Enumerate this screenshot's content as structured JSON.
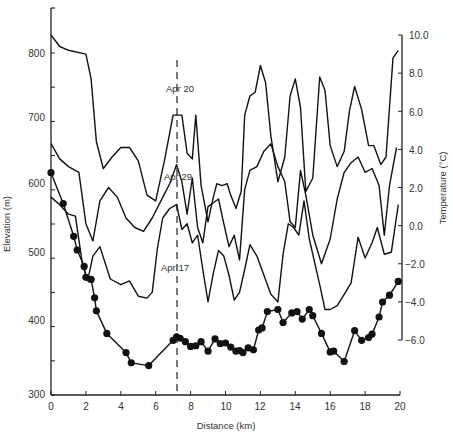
{
  "chart_data": {
    "type": "line",
    "title": "",
    "xlabel": "Distance (km)",
    "ylabel": "Elevation (m)",
    "y2label": "Temperature (°C)",
    "xlim": [
      0,
      20
    ],
    "ylim": [
      300,
      850
    ],
    "y2lim": [
      -6.0,
      10.0
    ],
    "xticks": [
      "0",
      "2",
      "4",
      "6",
      "8",
      "10",
      "12",
      "14",
      "16",
      "18",
      "20"
    ],
    "yticks": [
      "300",
      "400",
      "500",
      "600",
      "700",
      "800"
    ],
    "y2ticks": [
      "10.0",
      "8.0",
      "6.0",
      "4.0",
      "2.0",
      "0.0",
      "−2.0",
      "−4.0",
      "−6.0"
    ],
    "grid": false,
    "annotations": [
      {
        "text": "Apr 20",
        "x": 7.1,
        "y": 725
      },
      {
        "text": "Apr 29",
        "x": 7.1,
        "y": 602
      },
      {
        "text": "Apr 17",
        "x": 6.3,
        "y": 480
      },
      {
        "text": "dashed vertical line",
        "x": 7.2
      }
    ],
    "series": [
      {
        "name": "Elevation profile",
        "axis": "left",
        "marker": "filled-circle",
        "x": [
          0,
          0.7,
          1.3,
          1.5,
          1.9,
          2.0,
          2.3,
          2.5,
          2.6,
          3.2,
          4.3,
          4.6,
          5.6,
          7.0,
          7.2,
          7.4,
          7.7,
          8.0,
          8.3,
          8.6,
          9.0,
          9.4,
          9.7,
          10.0,
          10.3,
          10.6,
          10.8,
          11.0,
          11.3,
          11.6,
          11.9,
          12.1,
          12.4,
          13.0,
          13.3,
          13.8,
          14.1,
          14.4,
          14.8,
          15.0,
          15.5,
          16.0,
          16.2,
          16.8,
          17.4,
          17.8,
          18.2,
          18.4,
          18.8,
          19.0,
          19.4,
          19.9
        ],
        "y": [
          625,
          580,
          532,
          512,
          488,
          472,
          469,
          442,
          423,
          390,
          362,
          347,
          343,
          380,
          385,
          383,
          378,
          371,
          372,
          378,
          364,
          382,
          375,
          376,
          370,
          364,
          365,
          362,
          369,
          366,
          395,
          398,
          422,
          425,
          406,
          420,
          422,
          411,
          425,
          416,
          390,
          363,
          364,
          349,
          394,
          380,
          384,
          389,
          414,
          436,
          446,
          466
        ]
      },
      {
        "name": "Apr 20",
        "axis": "right",
        "x": [
          0,
          0.5,
          1.0,
          2.0,
          2.3,
          2.6,
          3.0,
          3.5,
          4.0,
          4.5,
          5.0,
          5.5,
          6.0,
          6.5,
          7.0,
          7.5,
          7.8,
          8.1,
          8.3,
          8.6,
          9.0,
          9.3,
          9.5,
          9.8,
          10.1,
          10.3,
          10.6,
          10.9,
          11.1,
          11.4,
          11.7,
          12.0,
          12.3,
          12.6,
          13.0,
          13.4,
          13.7,
          14.0,
          14.3,
          14.6,
          15.0,
          15.4,
          15.7,
          16.0,
          16.4,
          16.8,
          17.1,
          17.4,
          17.8,
          18.2,
          18.5,
          18.9,
          19.2,
          19.6,
          19.9
        ],
        "y": [
          10.0,
          9.4,
          9.2,
          9.0,
          7.7,
          4.4,
          3.0,
          3.6,
          4.1,
          4.1,
          3.4,
          1.6,
          1.3,
          3.4,
          5.8,
          5.8,
          3.8,
          3.5,
          5.8,
          2.1,
          0.2,
          1.5,
          2.2,
          2.1,
          2.2,
          1.6,
          0.9,
          1.8,
          5.8,
          6.8,
          7.0,
          8.4,
          7.5,
          4.7,
          2.3,
          3.6,
          6.8,
          7.7,
          6.2,
          1.8,
          2.5,
          7.8,
          7.1,
          4.2,
          3.1,
          3.9,
          6.0,
          7.3,
          6.1,
          4.2,
          4.2,
          3.2,
          3.6,
          8.8,
          9.2
        ]
      },
      {
        "name": "Apr 29",
        "axis": "right",
        "x": [
          0,
          0.5,
          1.0,
          1.6,
          2.0,
          2.4,
          2.8,
          3.3,
          3.8,
          4.3,
          4.8,
          5.3,
          5.8,
          6.3,
          6.8,
          7.2,
          7.5,
          7.8,
          8.1,
          8.4,
          8.7,
          9.0,
          9.3,
          9.6,
          9.9,
          10.2,
          10.5,
          10.8,
          11.1,
          11.4,
          11.8,
          12.2,
          12.6,
          13.0,
          13.4,
          13.7,
          14.0,
          14.3,
          14.6,
          15.0,
          15.5,
          16.0,
          16.4,
          16.8,
          17.2,
          17.6,
          18.0,
          18.4,
          18.8,
          19.1,
          19.4,
          19.8
        ],
        "y": [
          4.3,
          3.5,
          3.1,
          2.8,
          0.1,
          -0.8,
          1.3,
          2.0,
          1.5,
          0.4,
          -0.1,
          -0.3,
          0.4,
          1.3,
          2.2,
          3.2,
          2.3,
          0.6,
          2.5,
          -0.1,
          -0.9,
          1.0,
          1.2,
          1.4,
          0.1,
          -1.1,
          -0.5,
          -1.8,
          1.9,
          2.9,
          3.1,
          3.9,
          4.3,
          3.1,
          2.3,
          0.2,
          -0.1,
          2.9,
          1.6,
          -0.5,
          -2.0,
          -0.7,
          1.4,
          2.8,
          3.3,
          3.6,
          2.8,
          3.0,
          2.1,
          -0.5,
          2.1,
          4.1
        ]
      },
      {
        "name": "Apr 17",
        "axis": "right",
        "x": [
          0,
          0.5,
          1.0,
          1.4,
          1.8,
          2.1,
          2.4,
          2.8,
          3.4,
          4.0,
          4.5,
          5.0,
          5.5,
          5.8,
          6.1,
          6.4,
          6.8,
          7.2,
          7.5,
          7.8,
          8.1,
          8.4,
          8.7,
          9.0,
          9.3,
          9.6,
          9.9,
          10.2,
          10.5,
          10.8,
          11.1,
          11.4,
          11.8,
          12.2,
          12.6,
          13.0,
          13.3,
          13.6,
          13.9,
          14.2,
          14.5,
          14.8,
          15.1,
          15.4,
          15.7,
          16.0,
          16.4,
          16.8,
          17.2,
          17.6,
          18.0,
          18.4,
          18.7,
          19.1,
          19.5,
          19.9
        ],
        "y": [
          1.5,
          1.1,
          0.6,
          0.5,
          -2.0,
          -2.9,
          -1.6,
          -1.1,
          -2.8,
          -3.1,
          -2.9,
          -3.7,
          -3.8,
          -3.5,
          -1.2,
          0.4,
          0.9,
          1.1,
          -0.2,
          0.1,
          -0.9,
          -0.5,
          -2.3,
          -4.0,
          -2.5,
          -1.3,
          -1.6,
          -2.6,
          -3.9,
          -3.5,
          -2.3,
          -1.0,
          -1.6,
          -2.6,
          -3.6,
          -4.0,
          -1.5,
          0.1,
          -0.1,
          -0.5,
          1.3,
          -0.7,
          -1.9,
          -3.1,
          -4.4,
          -4.4,
          -4.2,
          -3.6,
          -3.0,
          -0.6,
          -1.7,
          -0.9,
          -0.1,
          -1.5,
          -1.4,
          1.1
        ]
      }
    ]
  },
  "labels": {
    "xlabel": "Distance (km)",
    "ylabel": "Elevation (m)",
    "y2label": "Temperature (°C)",
    "ann_apr20": "Apr 20",
    "ann_apr29": "Apr 29",
    "ann_apr17": "Apr 17",
    "xt0": "0",
    "xt1": "2",
    "xt2": "4",
    "xt3": "6",
    "xt4": "8",
    "xt5": "10",
    "xt6": "12",
    "xt7": "14",
    "xt8": "16",
    "xt9": "18",
    "xt10": "20",
    "yt300": "300",
    "yt400": "400",
    "yt500": "500",
    "yt600": "600",
    "yt700": "700",
    "yt800": "800",
    "y2t0": "10.0",
    "y2t1": "8.0",
    "y2t2": "6.0",
    "y2t3": "4.0",
    "y2t4": "2.0",
    "y2t5": "0.0",
    "y2t6": "−2.0",
    "y2t7": "−4.0",
    "y2t8": "−6.0"
  }
}
